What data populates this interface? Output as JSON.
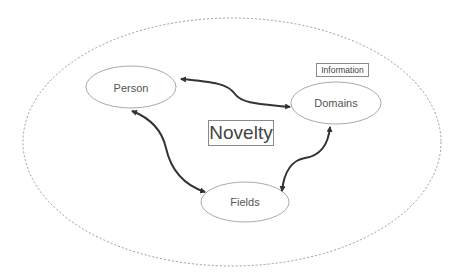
{
  "diagram": {
    "title": "Novelty",
    "annotation": "Information",
    "nodes": [
      {
        "id": "person",
        "label": "Person"
      },
      {
        "id": "domains",
        "label": "Domains"
      },
      {
        "id": "fields",
        "label": "Fields"
      }
    ],
    "edges": [
      {
        "from": "person",
        "to": "domains",
        "direction": "bidirectional"
      },
      {
        "from": "person",
        "to": "fields",
        "direction": "bidirectional"
      },
      {
        "from": "fields",
        "to": "domains",
        "direction": "bidirectional"
      }
    ],
    "colors": {
      "outline": "#9a9a9a",
      "arrow": "#333333",
      "text": "#555555"
    }
  }
}
